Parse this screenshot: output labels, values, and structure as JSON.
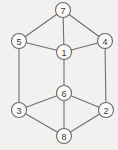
{
  "figure": {
    "title": "",
    "background_color": "#f2f1ef",
    "node_fill_color": "#fbfaf8",
    "node_stroke_color": "#6a6a6a",
    "edge_color": "#6e6e6e",
    "label_color": "#3a3a3a",
    "width": 118,
    "height": 150
  },
  "chart_data": {
    "type": "diagram",
    "diagram_type": "undirected-graph",
    "title": "",
    "node_count": 8,
    "edge_count": 13,
    "nodes": [
      {
        "id": "1",
        "label": "1",
        "x": 64,
        "y": 52,
        "r": 7.5
      },
      {
        "id": "2",
        "label": "2",
        "x": 106,
        "y": 110,
        "r": 7.5
      },
      {
        "id": "3",
        "label": "3",
        "x": 19,
        "y": 110,
        "r": 7.5
      },
      {
        "id": "4",
        "label": "4",
        "x": 105,
        "y": 41,
        "r": 7.5
      },
      {
        "id": "5",
        "label": "5",
        "x": 19,
        "y": 41,
        "r": 7.5
      },
      {
        "id": "6",
        "label": "6",
        "x": 64,
        "y": 93,
        "r": 7.5
      },
      {
        "id": "7",
        "label": "7",
        "x": 63,
        "y": 10,
        "r": 7.5
      },
      {
        "id": "8",
        "label": "8",
        "x": 64,
        "y": 136,
        "r": 7.5
      }
    ],
    "edges": [
      {
        "source": "7",
        "target": "5"
      },
      {
        "source": "7",
        "target": "4"
      },
      {
        "source": "7",
        "target": "1"
      },
      {
        "source": "5",
        "target": "1"
      },
      {
        "source": "1",
        "target": "4"
      },
      {
        "source": "5",
        "target": "3"
      },
      {
        "source": "4",
        "target": "2"
      },
      {
        "source": "1",
        "target": "6"
      },
      {
        "source": "6",
        "target": "3"
      },
      {
        "source": "6",
        "target": "2"
      },
      {
        "source": "6",
        "target": "8"
      },
      {
        "source": "3",
        "target": "8"
      },
      {
        "source": "2",
        "target": "8"
      }
    ]
  }
}
